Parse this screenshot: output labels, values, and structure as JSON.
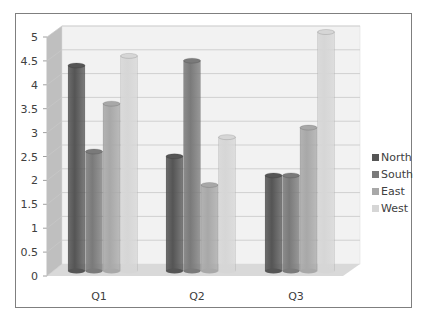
{
  "chart_data": {
    "type": "bar",
    "style": "3d-clustered-cylinder",
    "title": "",
    "xlabel": "",
    "ylabel": "",
    "categories": [
      "Q1",
      "Q2",
      "Q3"
    ],
    "series": [
      {
        "name": "North",
        "values": [
          4.3,
          2.4,
          2.0
        ],
        "color": "#555555"
      },
      {
        "name": "South",
        "values": [
          2.5,
          4.4,
          2.0
        ],
        "color": "#7a7a7a"
      },
      {
        "name": "East",
        "values": [
          3.5,
          1.8,
          3.0
        ],
        "color": "#a8a8a8"
      },
      {
        "name": "West",
        "values": [
          4.5,
          2.8,
          5.0
        ],
        "color": "#d6d6d6"
      }
    ],
    "ylim": [
      0,
      5
    ],
    "yticks": [
      "0",
      "0.5",
      "1",
      "1.5",
      "2",
      "2.5",
      "3",
      "3.5",
      "4",
      "4.5",
      "5"
    ],
    "grid": true,
    "legend_position": "right"
  }
}
